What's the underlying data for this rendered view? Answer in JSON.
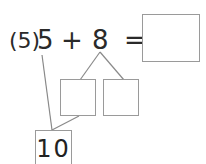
{
  "problem": {
    "number_label": "(5)",
    "first_operand": "5",
    "operator": "+",
    "second_operand": "8",
    "equals": "=",
    "answer_value": "",
    "decomposition": {
      "left_part_value": "",
      "right_part_value": ""
    },
    "make_ten_value": "10"
  },
  "colors": {
    "line": "#8a8a8a",
    "box_border": "#9a9a9a",
    "text": "#2a2a2a"
  }
}
